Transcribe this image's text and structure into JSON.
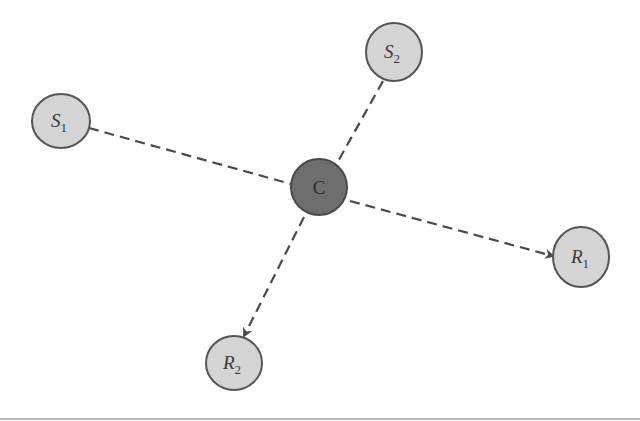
{
  "diagram": {
    "type": "relay-network",
    "colors": {
      "background": "#ffffff",
      "node_fill": "#d4d4d4",
      "node_stroke": "#555555",
      "center_fill": "#6e6e6e",
      "center_stroke": "#4a4a4a",
      "edge": "#4a4a4a"
    },
    "nodes": [
      {
        "id": "S1",
        "letter": "S",
        "sub": "1",
        "role": "source",
        "cx": 61,
        "cy": 121,
        "rx": 29,
        "ry": 27
      },
      {
        "id": "S2",
        "letter": "S",
        "sub": "2",
        "role": "source",
        "cx": 394,
        "cy": 52,
        "rx": 28,
        "ry": 29
      },
      {
        "id": "C",
        "letter": "C",
        "sub": "",
        "role": "relay",
        "cx": 319,
        "cy": 187,
        "rx": 28,
        "ry": 28
      },
      {
        "id": "R1",
        "letter": "R",
        "sub": "1",
        "role": "receiver",
        "cx": 581,
        "cy": 257,
        "rx": 28,
        "ry": 30
      },
      {
        "id": "R2",
        "letter": "R",
        "sub": "2",
        "role": "receiver",
        "cx": 234,
        "cy": 363,
        "rx": 28,
        "ry": 27
      }
    ],
    "edges": [
      {
        "from": "S1",
        "to": "C",
        "style": "dashed",
        "arrow": false
      },
      {
        "from": "S2",
        "to": "C",
        "style": "dashed",
        "arrow": false
      },
      {
        "from": "C",
        "to": "R1",
        "style": "dashed",
        "arrow": true
      },
      {
        "from": "C",
        "to": "R2",
        "style": "dashed",
        "arrow": true
      }
    ],
    "labels": {
      "s1_letter": "S",
      "s1_sub": "1",
      "s2_letter": "S",
      "s2_sub": "2",
      "c_letter": "C",
      "r1_letter": "R",
      "r1_sub": "1",
      "r2_letter": "R",
      "r2_sub": "2"
    }
  }
}
